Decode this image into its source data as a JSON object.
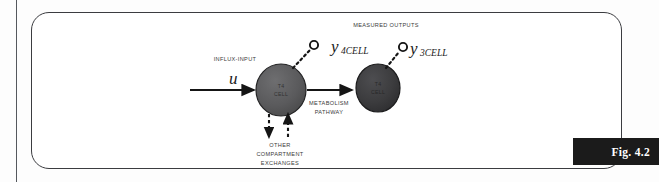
{
  "figure": {
    "caption_label": "Fig. 4.2",
    "colors": {
      "frame_border": "#3b3c40",
      "caption_band_bg": "#1b1b1b",
      "caption_band_text": "#ffffff",
      "cell_fill": "#5c5c5e",
      "cell_fill_dark": "#3a3a3c",
      "arrow_stroke": "#151515",
      "label_text": "#3a3a3a"
    }
  },
  "diagram": {
    "title_label": "MEASURED OUTPUTS",
    "input_label": "INFLUX-INPUT",
    "input_variable": {
      "base": "u",
      "subscript": ""
    },
    "pathway_label_line1": "METABOLISM",
    "pathway_label_line2": "PATHWAY",
    "exchange_label_line1": "OTHER",
    "exchange_label_line2": "COMPARTMENT",
    "exchange_label_line3": "EXCHANGES",
    "cells": [
      {
        "name": "t4-cell",
        "label_line1": "T4",
        "label_line2": "CELL"
      },
      {
        "name": "t3-cell",
        "label_line1": "T3",
        "label_line2": "CELL"
      }
    ],
    "outputs": [
      {
        "name": "y4cell",
        "base": "y",
        "subscript": "4CELL"
      },
      {
        "name": "y3cell",
        "base": "y",
        "subscript": "3CELL"
      }
    ]
  }
}
